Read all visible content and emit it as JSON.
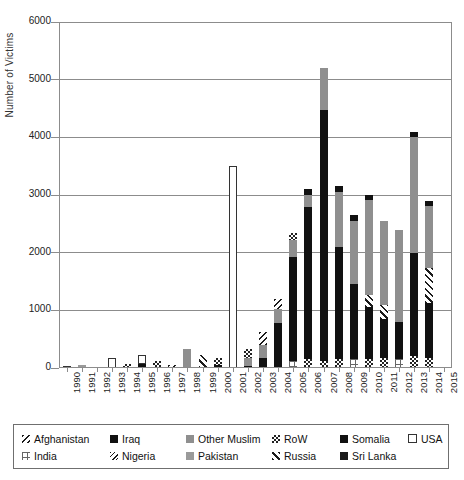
{
  "chart_data": {
    "type": "bar",
    "stacked": true,
    "title": "",
    "xlabel": "",
    "ylabel": "Number of Victims",
    "ylim": [
      0,
      6000
    ],
    "yticks": [
      0,
      1000,
      2000,
      3000,
      4000,
      5000,
      6000
    ],
    "ytick_labels": [
      "0",
      "1000",
      "2000",
      "3000",
      "4000",
      "5000",
      "6000"
    ],
    "grid": true,
    "legend_position": "bottom",
    "categories": [
      "1990",
      "1991",
      "1992",
      "1993",
      "1994",
      "1995",
      "1996",
      "1997",
      "1998",
      "1999",
      "2000",
      "2001",
      "2002",
      "2003",
      "2004",
      "2005",
      "2006",
      "2007",
      "2008",
      "2009",
      "2010",
      "2011",
      "2012",
      "2013",
      "2014",
      "2015"
    ],
    "series": [
      {
        "name": "Afghanistan",
        "pattern": "afg",
        "values": [
          0,
          0,
          0,
          0,
          0,
          0,
          0,
          0,
          0,
          0,
          0,
          0,
          0,
          0,
          0,
          0,
          0,
          0,
          0,
          0,
          0,
          0,
          0,
          0,
          0,
          0
        ]
      },
      {
        "name": "Iraq",
        "pattern": "iraq",
        "values": [
          0,
          0,
          0,
          0,
          0,
          60,
          0,
          0,
          0,
          0,
          0,
          0,
          30,
          80,
          280,
          900,
          1700,
          4450,
          2150,
          1450,
          1200,
          700,
          620,
          720,
          1100,
          0
        ]
      },
      {
        "name": "Other Muslim",
        "pattern": "otherm",
        "values": [
          0,
          0,
          0,
          0,
          0,
          0,
          0,
          0,
          120,
          0,
          0,
          0,
          0,
          0,
          0,
          0,
          0,
          700,
          0,
          0,
          0,
          0,
          0,
          0,
          0,
          0
        ]
      },
      {
        "name": "RoW",
        "pattern": "row",
        "values": [
          0,
          0,
          0,
          0,
          0,
          0,
          30,
          0,
          0,
          0,
          60,
          0,
          0,
          0,
          0,
          0,
          0,
          0,
          0,
          0,
          0,
          0,
          0,
          0,
          0,
          0
        ]
      },
      {
        "name": "Somalia",
        "pattern": "somalia",
        "values": [
          0,
          0,
          0,
          0,
          0,
          0,
          0,
          0,
          0,
          0,
          0,
          0,
          0,
          0,
          0,
          0,
          0,
          0,
          0,
          0,
          0,
          0,
          0,
          0,
          0,
          0
        ]
      },
      {
        "name": "USA",
        "pattern": "usa",
        "values": [
          0,
          0,
          0,
          150,
          0,
          110,
          40,
          0,
          0,
          0,
          0,
          3450,
          0,
          0,
          0,
          0,
          0,
          0,
          0,
          0,
          0,
          0,
          0,
          0,
          0,
          0
        ]
      },
      {
        "name": "India",
        "pattern": "india",
        "values": [
          0,
          0,
          0,
          0,
          0,
          0,
          0,
          0,
          0,
          0,
          0,
          0,
          0,
          0,
          0,
          0,
          0,
          0,
          0,
          260,
          0,
          300,
          0,
          0,
          0,
          0
        ]
      },
      {
        "name": "Nigeria",
        "pattern": "nigeria",
        "values": [
          0,
          0,
          0,
          0,
          0,
          0,
          0,
          0,
          0,
          0,
          0,
          0,
          0,
          0,
          0,
          0,
          0,
          0,
          0,
          0,
          0,
          0,
          0,
          0,
          0,
          0
        ]
      },
      {
        "name": "Pakistan",
        "pattern": "pakistan",
        "values": [
          0,
          40,
          0,
          0,
          0,
          0,
          0,
          0,
          0,
          0,
          0,
          0,
          0,
          0,
          0,
          0,
          0,
          0,
          0,
          0,
          0,
          0,
          0,
          0,
          0,
          0
        ]
      },
      {
        "name": "Russia",
        "pattern": "russia",
        "values": [
          0,
          0,
          0,
          0,
          0,
          0,
          0,
          0,
          0,
          200,
          0,
          0,
          0,
          0,
          0,
          0,
          0,
          0,
          0,
          0,
          0,
          0,
          0,
          0,
          0,
          0
        ]
      },
      {
        "name": "Sri Lanka",
        "pattern": "srilanka",
        "values": [
          0,
          0,
          0,
          0,
          0,
          0,
          0,
          0,
          0,
          0,
          0,
          0,
          0,
          0,
          0,
          0,
          0,
          0,
          0,
          0,
          0,
          0,
          0,
          0,
          0,
          0
        ]
      }
    ],
    "totals": [
      "25",
      "50",
      "15",
      "170",
      "55",
      "220",
      "120",
      "45",
      "330",
      "230",
      "180",
      "3500",
      "330",
      "620",
      "1200",
      "2350",
      "3100",
      "5200",
      "3150",
      "2650",
      "3000",
      "2550",
      "2400",
      "4100",
      "2900",
      "0"
    ],
    "stacks": [
      {
        "year": "1990",
        "segments": [
          {
            "s": "USA",
            "v": 25
          }
        ]
      },
      {
        "year": "1991",
        "segments": [
          {
            "s": "Pakistan",
            "v": 50
          }
        ]
      },
      {
        "year": "1992",
        "segments": [
          {
            "s": "Iraq",
            "v": 15
          }
        ]
      },
      {
        "year": "1993",
        "segments": [
          {
            "s": "USA",
            "v": 170
          }
        ]
      },
      {
        "year": "1994",
        "segments": [
          {
            "s": "Iraq",
            "v": 20
          },
          {
            "s": "RoW",
            "v": 35
          }
        ]
      },
      {
        "year": "1995",
        "segments": [
          {
            "s": "Iraq",
            "v": 70
          },
          {
            "s": "USA",
            "v": 150
          }
        ]
      },
      {
        "year": "1996",
        "segments": [
          {
            "s": "Iraq",
            "v": 25
          },
          {
            "s": "RoW",
            "v": 95
          }
        ]
      },
      {
        "year": "1997",
        "segments": [
          {
            "s": "Iraq",
            "v": 15
          },
          {
            "s": "Afghanistan",
            "v": 30
          }
        ]
      },
      {
        "year": "1998",
        "segments": [
          {
            "s": "Other Muslim",
            "v": 330
          }
        ]
      },
      {
        "year": "1999",
        "segments": [
          {
            "s": "Russia",
            "v": 230
          }
        ]
      },
      {
        "year": "2000",
        "segments": [
          {
            "s": "Iraq",
            "v": 50
          },
          {
            "s": "RoW",
            "v": 130
          }
        ]
      },
      {
        "year": "2001",
        "segments": [
          {
            "s": "USA",
            "v": 3500
          }
        ]
      },
      {
        "year": "2002",
        "segments": [
          {
            "s": "Iraq",
            "v": 40
          },
          {
            "s": "Other Muslim",
            "v": 140
          },
          {
            "s": "RoW",
            "v": 150
          }
        ]
      },
      {
        "year": "2003",
        "segments": [
          {
            "s": "Iraq",
            "v": 180
          },
          {
            "s": "Other Muslim",
            "v": 220
          },
          {
            "s": "Afghanistan",
            "v": 220
          }
        ]
      },
      {
        "year": "2004",
        "segments": [
          {
            "s": "Iraq",
            "v": 780
          },
          {
            "s": "Other Muslim",
            "v": 250
          },
          {
            "s": "Afghanistan",
            "v": 170
          }
        ]
      },
      {
        "year": "2005",
        "segments": [
          {
            "s": "India",
            "v": 120
          },
          {
            "s": "Iraq",
            "v": 1800
          },
          {
            "s": "Other Muslim",
            "v": 300
          },
          {
            "s": "RoW",
            "v": 130
          }
        ]
      },
      {
        "year": "2006",
        "segments": [
          {
            "s": "RoW",
            "v": 150
          },
          {
            "s": "Iraq",
            "v": 2650
          },
          {
            "s": "Other Muslim",
            "v": 200
          },
          {
            "s": "Somalia",
            "v": 100
          }
        ]
      },
      {
        "year": "2007",
        "segments": [
          {
            "s": "RoW",
            "v": 130
          },
          {
            "s": "Iraq",
            "v": 4350
          },
          {
            "s": "Other Muslim",
            "v": 720
          }
        ]
      },
      {
        "year": "2008",
        "segments": [
          {
            "s": "RoW",
            "v": 150
          },
          {
            "s": "Iraq",
            "v": 1950
          },
          {
            "s": "Other Muslim",
            "v": 950
          },
          {
            "s": "Somalia",
            "v": 100
          }
        ]
      },
      {
        "year": "2009",
        "segments": [
          {
            "s": "India",
            "v": 150
          },
          {
            "s": "Iraq",
            "v": 1300
          },
          {
            "s": "Other Muslim",
            "v": 1100
          },
          {
            "s": "Somalia",
            "v": 100
          }
        ]
      },
      {
        "year": "2010",
        "segments": [
          {
            "s": "RoW",
            "v": 160
          },
          {
            "s": "Iraq",
            "v": 900
          },
          {
            "s": "Russia",
            "v": 200
          },
          {
            "s": "Other Muslim",
            "v": 1650
          },
          {
            "s": "Somalia",
            "v": 90
          }
        ]
      },
      {
        "year": "2011",
        "segments": [
          {
            "s": "RoW",
            "v": 170
          },
          {
            "s": "Iraq",
            "v": 680
          },
          {
            "s": "Russia",
            "v": 250
          },
          {
            "s": "Other Muslim",
            "v": 1450
          }
        ]
      },
      {
        "year": "2012",
        "segments": [
          {
            "s": "India",
            "v": 160
          },
          {
            "s": "Iraq",
            "v": 640
          },
          {
            "s": "Other Muslim",
            "v": 1600
          }
        ]
      },
      {
        "year": "2013",
        "segments": [
          {
            "s": "RoW",
            "v": 200
          },
          {
            "s": "Iraq",
            "v": 1800
          },
          {
            "s": "Other Muslim",
            "v": 2000
          },
          {
            "s": "Somalia",
            "v": 100
          }
        ]
      },
      {
        "year": "2014",
        "segments": [
          {
            "s": "RoW",
            "v": 180
          },
          {
            "s": "Iraq",
            "v": 950
          },
          {
            "s": "Russia",
            "v": 600
          },
          {
            "s": "Other Muslim",
            "v": 1080
          },
          {
            "s": "Somalia",
            "v": 90
          }
        ]
      },
      {
        "year": "2015",
        "segments": []
      }
    ],
    "legend": [
      {
        "label": "Afghanistan",
        "pattern": "afg"
      },
      {
        "label": "Iraq",
        "pattern": "iraq"
      },
      {
        "label": "Other Muslim",
        "pattern": "otherm"
      },
      {
        "label": "RoW",
        "pattern": "row"
      },
      {
        "label": "Somalia",
        "pattern": "somalia"
      },
      {
        "label": "USA",
        "pattern": "usa"
      },
      {
        "label": "India",
        "pattern": "india"
      },
      {
        "label": "Nigeria",
        "pattern": "nigeria"
      },
      {
        "label": "Pakistan",
        "pattern": "pakistan"
      },
      {
        "label": "Russia",
        "pattern": "russia"
      },
      {
        "label": "Sri Lanka",
        "pattern": "srilanka"
      }
    ],
    "legend_rows": [
      [
        "Afghanistan",
        "Iraq",
        "Other Muslim",
        "RoW",
        "Somalia",
        "USA"
      ],
      [
        "India",
        "Nigeria",
        "Pakistan",
        "Russia",
        "Sri Lanka"
      ]
    ],
    "colors": {
      "axis": "#8c8c8c",
      "gridline": "#8c8c8c",
      "dark": "#111111",
      "grey": "#8f8f8f",
      "background": "#ffffff",
      "legend_border": "#6f6f6f"
    }
  }
}
